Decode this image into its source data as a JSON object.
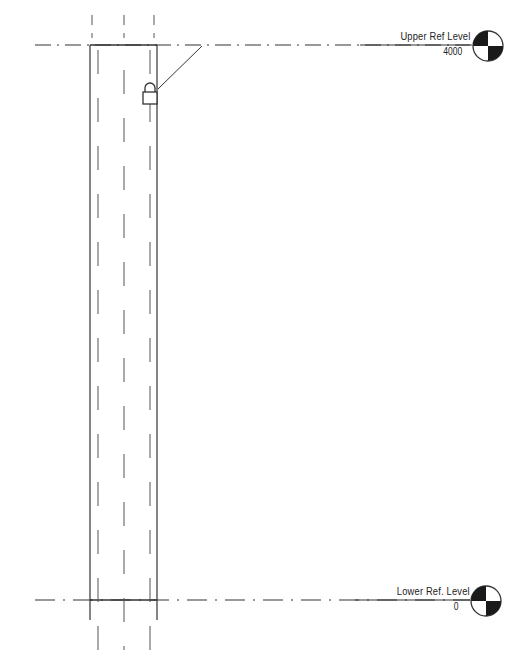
{
  "levels": [
    {
      "name": "Upper Ref Level",
      "elevation": "4000",
      "y": 45
    },
    {
      "name": "Lower Ref. Level",
      "elevation": "0",
      "y": 600
    }
  ],
  "column": {
    "left_x": 90,
    "right_x": 157,
    "inner_left_x": 97,
    "center_x": 123,
    "inner_right_x": 150,
    "top_y": 45,
    "bottom_y": 600
  },
  "lock": {
    "icon": "padlock-icon",
    "state": "locked"
  },
  "colors": {
    "line": "#333333",
    "hidden_line": "#555555",
    "head_fill": "#1a1a1a",
    "background": "#ffffff"
  }
}
